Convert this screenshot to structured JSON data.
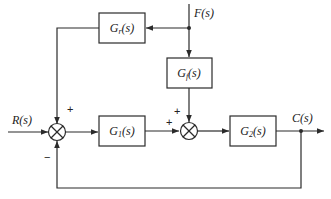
{
  "diagram": {
    "type": "block-diagram",
    "blocks": {
      "gr": {
        "label": "Gr(s)",
        "main": "G",
        "sub": "r",
        "tail": "(s)"
      },
      "gf": {
        "label": "Gf(s)",
        "main": "G",
        "sub": "f",
        "tail": "(s)"
      },
      "g1": {
        "label": "G1(s)",
        "main": "G",
        "sub": "1",
        "tail": "(s)"
      },
      "g2": {
        "label": "G2(s)",
        "main": "G",
        "sub": "2",
        "tail": "(s)"
      }
    },
    "signals": {
      "input": "R(s)",
      "disturbance": "F(s)",
      "output": "C(s)"
    },
    "summing_junctions": {
      "sum1": {
        "signs": {
          "top": "+",
          "bottom": "−"
        }
      },
      "sum2": {
        "signs": {
          "top": "+",
          "left": "+"
        }
      }
    },
    "connections": [
      {
        "from": "R(s)",
        "to": "sum1",
        "sign": "+"
      },
      {
        "from": "F(s)",
        "to": "Gr(s)"
      },
      {
        "from": "Gr(s)",
        "to": "sum1",
        "sign": "+"
      },
      {
        "from": "F(s)",
        "to": "Gf(s)"
      },
      {
        "from": "sum1",
        "to": "G1(s)"
      },
      {
        "from": "G1(s)",
        "to": "sum2",
        "sign": "+"
      },
      {
        "from": "Gf(s)",
        "to": "sum2",
        "sign": "+"
      },
      {
        "from": "sum2",
        "to": "G2(s)"
      },
      {
        "from": "G2(s)",
        "to": "C(s)"
      },
      {
        "from": "C(s)",
        "to": "sum1",
        "sign": "−"
      }
    ]
  }
}
